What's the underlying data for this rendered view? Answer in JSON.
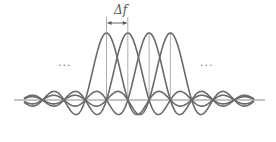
{
  "diagram": {
    "title": "",
    "spacing_label": "Δf",
    "ellipsis_left": "...",
    "ellipsis_right": "...",
    "colors": {
      "curve": "#6a6a6a",
      "axis": "#8a8a8a",
      "marker": "#9a9a9a",
      "text": "#555555"
    },
    "subcarriers": [
      {
        "index": 1,
        "center_x": 106.5
      },
      {
        "index": 2,
        "center_x": 127.8
      },
      {
        "index": 3,
        "center_x": 149.1
      },
      {
        "index": 4,
        "center_x": 170.4
      }
    ],
    "spacing_px": 21.3,
    "baseline_y": 100,
    "peak_amplitude_px": 67,
    "x_range": [
      24,
      254
    ],
    "axis_range": [
      14,
      265
    ]
  }
}
